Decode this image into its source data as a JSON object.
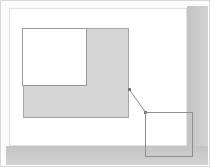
{
  "figure": {
    "background_color": "#ffffff",
    "frame": {
      "border_color": "#d9d9d9",
      "shadow_color": "#c9c9c9"
    }
  },
  "page": {
    "label": "page-area",
    "fill_color": "#ffffff",
    "border_color": "#e2e2e2",
    "x": 9,
    "y": 8,
    "width": 178,
    "height": 138
  },
  "shapes": {
    "shaded_rect": {
      "label": "shaded-region",
      "fill_color": "#d6d6d6",
      "border_color": "#a6a6a6",
      "x": 23,
      "y": 28,
      "width": 106,
      "height": 90
    },
    "inset_rect": {
      "label": "inset-white-region",
      "fill_color": "#ffffff",
      "border_color": "#9a9a9a",
      "x": 22,
      "y": 28,
      "width": 65,
      "height": 58
    },
    "detail_square": {
      "label": "detail-callout-square",
      "fill_color": "transparent",
      "border_color": "#8f8f8f",
      "x": 145,
      "y": 112,
      "width": 48,
      "height": 45
    }
  },
  "connector": {
    "label": "leader-line",
    "color": "#8c8c8c",
    "from_x": 129,
    "from_y": 89,
    "to_x": 146,
    "to_y": 113
  }
}
